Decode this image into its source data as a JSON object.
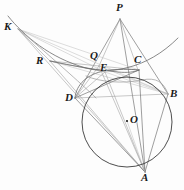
{
  "figure": {
    "canvas": {
      "width": 184,
      "height": 190
    },
    "colors": {
      "background": "#fdfdfd",
      "stroke_dark": "#3a3a3a",
      "stroke_mid": "#6b6b6b",
      "stroke_light": "#9a9a9a",
      "stroke_faint": "#b4b4b4",
      "label": "#1a1a1a"
    },
    "points": [
      {
        "name": "P",
        "label": "P",
        "x": 120,
        "y": 19,
        "lx": 116,
        "ly": 2,
        "dot": false
      },
      {
        "name": "K",
        "label": "K",
        "x": 18,
        "y": 29,
        "lx": 4,
        "ly": 21,
        "dot": false
      },
      {
        "name": "Q",
        "label": "Q",
        "x": 99,
        "y": 66,
        "lx": 90,
        "ly": 50,
        "dot": false
      },
      {
        "name": "C",
        "label": "C",
        "x": 138,
        "y": 70,
        "lx": 134,
        "ly": 54,
        "dot": false
      },
      {
        "name": "R",
        "label": "R",
        "x": 50,
        "y": 61,
        "lx": 36,
        "ly": 55,
        "dot": false
      },
      {
        "name": "E",
        "label": "E",
        "x": 105,
        "y": 72,
        "lx": 100,
        "ly": 62,
        "dot": false
      },
      {
        "name": "D",
        "label": "D",
        "x": 75,
        "y": 98,
        "lx": 65,
        "ly": 92,
        "dot": false
      },
      {
        "name": "B",
        "label": "B",
        "x": 168,
        "y": 94,
        "lx": 170,
        "ly": 88,
        "dot": false
      },
      {
        "name": "O",
        "label": "O",
        "x": 127,
        "y": 121,
        "lx": 130,
        "ly": 114,
        "dot": true
      },
      {
        "name": "A",
        "label": "A",
        "x": 145,
        "y": 172,
        "lx": 141,
        "ly": 172,
        "dot": false
      }
    ],
    "circle": {
      "name": "circumcircle-ABD",
      "cx": 127,
      "cy": 122,
      "r": 45
    },
    "arcs": [
      {
        "name": "arc-K-R-E-C-right",
        "d": "M 8 16 C 24 36 50 58 86 68 C 110 74 146 70 178 38",
        "weight": "mid"
      },
      {
        "name": "arc-K-R-D-inner",
        "d": "M 18 29 C 34 42 52 58 70 74 C 80 83 90 92 96 98",
        "weight": "light"
      },
      {
        "name": "arc-R-Q-C-bow",
        "d": "M 50 61 C 72 66 96 70 118 72 C 128 73 134 72 139 70",
        "weight": "mid"
      },
      {
        "name": "arc-D-E-C-upper",
        "d": "M 75 98 C 76 84 88 74 104 71 C 118 69 130 69 139 70",
        "weight": "mid"
      },
      {
        "name": "arc-E-C-B-lower",
        "d": "M 86 76 C 100 82 122 84 142 80 C 156 77 164 82 168 94",
        "weight": "light"
      }
    ],
    "segments": [
      {
        "name": "seg-P-A",
        "x1": 120,
        "y1": 19,
        "x2": 145,
        "y2": 172,
        "weight": "mid"
      },
      {
        "name": "seg-P-D",
        "x1": 120,
        "y1": 19,
        "x2": 75,
        "y2": 98,
        "weight": "mid"
      },
      {
        "name": "seg-P-B",
        "x1": 120,
        "y1": 19,
        "x2": 168,
        "y2": 94,
        "weight": "mid"
      },
      {
        "name": "seg-P-C",
        "x1": 120,
        "y1": 19,
        "x2": 138,
        "y2": 70,
        "weight": "light"
      },
      {
        "name": "seg-P-Q",
        "x1": 120,
        "y1": 19,
        "x2": 99,
        "y2": 66,
        "weight": "light"
      },
      {
        "name": "seg-K-C",
        "x1": 18,
        "y1": 29,
        "x2": 139,
        "y2": 70,
        "weight": "faint"
      },
      {
        "name": "seg-K-B",
        "x1": 18,
        "y1": 29,
        "x2": 168,
        "y2": 94,
        "weight": "faint"
      },
      {
        "name": "seg-K-E",
        "x1": 18,
        "y1": 29,
        "x2": 105,
        "y2": 72,
        "weight": "faint"
      },
      {
        "name": "seg-K-A",
        "x1": 18,
        "y1": 29,
        "x2": 145,
        "y2": 172,
        "weight": "light"
      },
      {
        "name": "seg-K-R",
        "x1": 18,
        "y1": 29,
        "x2": 50,
        "y2": 61,
        "weight": "light"
      },
      {
        "name": "seg-R-C",
        "x1": 50,
        "y1": 61,
        "x2": 139,
        "y2": 70,
        "weight": "light"
      },
      {
        "name": "seg-R-B",
        "x1": 50,
        "y1": 61,
        "x2": 168,
        "y2": 94,
        "weight": "faint"
      },
      {
        "name": "seg-R-A",
        "x1": 50,
        "y1": 61,
        "x2": 145,
        "y2": 172,
        "weight": "light"
      },
      {
        "name": "seg-R-E",
        "x1": 50,
        "y1": 61,
        "x2": 105,
        "y2": 72,
        "weight": "light"
      },
      {
        "name": "seg-D-C",
        "x1": 75,
        "y1": 98,
        "x2": 139,
        "y2": 70,
        "weight": "mid"
      },
      {
        "name": "seg-D-B",
        "x1": 75,
        "y1": 98,
        "x2": 168,
        "y2": 94,
        "weight": "light"
      },
      {
        "name": "seg-D-A",
        "x1": 75,
        "y1": 98,
        "x2": 145,
        "y2": 172,
        "weight": "mid"
      },
      {
        "name": "seg-C-A",
        "x1": 139,
        "y1": 70,
        "x2": 145,
        "y2": 172,
        "weight": "mid"
      },
      {
        "name": "seg-B-A",
        "x1": 168,
        "y1": 94,
        "x2": 145,
        "y2": 172,
        "weight": "mid"
      },
      {
        "name": "seg-Q-A",
        "x1": 99,
        "y1": 66,
        "x2": 145,
        "y2": 172,
        "weight": "light"
      },
      {
        "name": "seg-E-A",
        "x1": 105,
        "y1": 72,
        "x2": 145,
        "y2": 172,
        "weight": "light"
      },
      {
        "name": "seg-Q-B",
        "x1": 99,
        "y1": 66,
        "x2": 168,
        "y2": 94,
        "weight": "faint"
      },
      {
        "name": "seg-Q-D",
        "x1": 99,
        "y1": 66,
        "x2": 75,
        "y2": 98,
        "weight": "light"
      },
      {
        "name": "seg-E-D",
        "x1": 105,
        "y1": 72,
        "x2": 75,
        "y2": 98,
        "weight": "light"
      },
      {
        "name": "seg-E-B",
        "x1": 105,
        "y1": 72,
        "x2": 168,
        "y2": 94,
        "weight": "faint"
      },
      {
        "name": "seg-O-A",
        "x1": 127,
        "y1": 121,
        "x2": 145,
        "y2": 172,
        "weight": "faint"
      }
    ]
  }
}
